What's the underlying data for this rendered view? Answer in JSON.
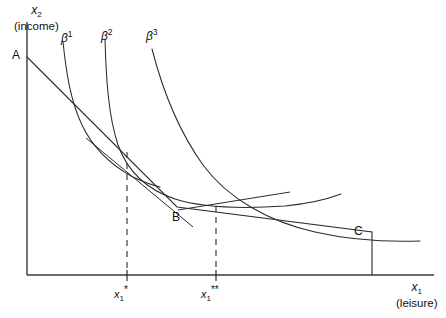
{
  "figure": {
    "title_visible": false,
    "background_color": "#ffffff",
    "line_color": "#2b2b2b",
    "axis_color": "#3a3a3a"
  },
  "axes": {
    "y": {
      "var": "x",
      "sub": "2",
      "caption": "(income)",
      "x_px": 27,
      "top_px": 22,
      "bottom_px": 275
    },
    "x": {
      "var": "x",
      "sub": "1",
      "caption": "(leisure)",
      "y_px": 275,
      "left_px": 27,
      "right_px": 434
    }
  },
  "points": [
    {
      "id": "A",
      "label": "A",
      "x": 27,
      "y": 57,
      "label_x": 13,
      "label_y": 50
    },
    {
      "id": "B",
      "label": "B",
      "x": 177,
      "y": 207,
      "label_x": 172,
      "label_y": 211
    },
    {
      "id": "C",
      "label": "C",
      "x": 372,
      "y": 232,
      "label_x": 355,
      "label_y": 226
    }
  ],
  "curves": [
    {
      "id": "beta1",
      "label": "β",
      "exponent": "1",
      "label_x": 61,
      "label_y": 33,
      "path": "M 63,42 C 66,70 70,100 82,125 C 92,146 108,163 131,176 C 143,182 152,185 160,187"
    },
    {
      "id": "beta2",
      "label": "β",
      "exponent": "2",
      "label_x": 102,
      "label_y": 31,
      "path": "M 105,39 C 106,75 108,115 118,145 C 128,173 148,190 175,199 C 200,207 240,209 285,206 C 305,204 325,200 341,194"
    },
    {
      "id": "beta3",
      "label": "β",
      "exponent": "3",
      "label_x": 147,
      "label_y": 31,
      "path": "M 152,49 C 162,88 178,130 203,165 C 228,199 270,222 315,232 C 350,240 390,242 420,241"
    }
  ],
  "budget": {
    "description": "kinked budget constraint A-B-C",
    "path": "M 27,57 L 177,207 L 372,232 L 372,275",
    "segment1": {
      "from": "A",
      "to": "B"
    },
    "segment2": {
      "from": "B",
      "to": "C"
    },
    "vertical_drop": {
      "from": "C",
      "to_axis": true
    }
  },
  "tangents": [
    {
      "id": "tangent-beta1",
      "path": "M 86,138 L 193,227",
      "tangency_x": 127,
      "tangency_y": 172
    },
    {
      "id": "tangent-beta2",
      "path": "M 178,210 L 290,192",
      "tangency_x": 216,
      "tangency_y": 205
    }
  ],
  "optima": [
    {
      "id": "x1-star",
      "var": "x",
      "sub": "1",
      "stars": "*",
      "tick_x": 127,
      "label_x": 127,
      "label_y": 286,
      "drop_from_y": 152,
      "drop_to_y": 272
    },
    {
      "id": "x1-star-star",
      "var": "x",
      "sub": "1",
      "stars": "**",
      "tick_x": 216,
      "label_x": 216,
      "label_y": 286,
      "drop_from_y": 206,
      "drop_to_y": 272
    }
  ],
  "labels": {
    "y_axis_caption": "(income)",
    "x_axis_caption": "(leisure)",
    "point_a": "A",
    "point_b": "B",
    "point_c": "C",
    "beta1": "β",
    "beta2": "β",
    "beta3": "β",
    "exp1": "1",
    "exp2": "2",
    "exp3": "3",
    "var_x": "x",
    "sub_1": "1",
    "sub_2": "2",
    "star_one": "*",
    "star_two": "**"
  }
}
